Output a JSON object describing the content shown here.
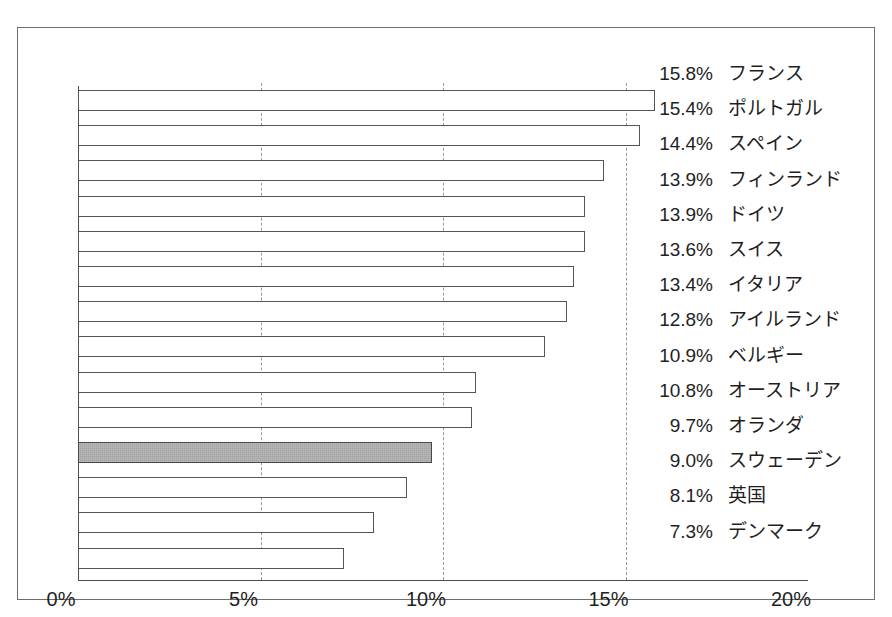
{
  "chart_data": {
    "type": "bar",
    "orientation": "horizontal",
    "title": "",
    "subtitle": "",
    "xlabel": "",
    "ylabel": "",
    "xlim": [
      0,
      20
    ],
    "xticks": [
      "0%",
      "5%",
      "10%",
      "15%",
      "20%"
    ],
    "xtick_values": [
      0,
      5,
      10,
      15,
      20
    ],
    "grid": true,
    "legend": null,
    "categories": [
      "フランス",
      "ポルトガル",
      "スペイン",
      "フィンランド",
      "ドイツ",
      "スイス",
      "イタリア",
      "アイルランド",
      "ベルギー",
      "オーストリア",
      "オランダ",
      "スウェーデン",
      "英国",
      "デンマーク"
    ],
    "values": [
      15.8,
      15.4,
      14.4,
      13.9,
      13.9,
      13.6,
      13.4,
      12.8,
      10.9,
      10.8,
      9.7,
      9.0,
      8.1,
      7.3
    ],
    "value_labels": [
      "15.8%",
      "15.4%",
      "14.4%",
      "13.9%",
      "13.9%",
      "13.6%",
      "13.4%",
      "12.8%",
      "10.9%",
      "10.8%",
      "9.7%",
      "9.0%",
      "8.1%",
      "7.3%"
    ],
    "highlighted_index": 10,
    "colors": {
      "bar_fill": "#ffffff",
      "bar_edge": "#555555",
      "highlight_fill": "#a3a3a3",
      "highlight_edge": "#4a4a4a",
      "gridline": "#9a9a9a",
      "axis": "#4d4d4d",
      "frame": "#6e6e6e",
      "text": "#1f1f1f"
    }
  }
}
